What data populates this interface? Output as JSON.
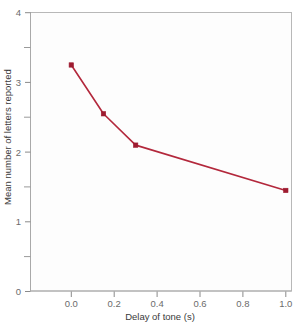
{
  "chart_data": {
    "type": "line",
    "title": "",
    "subtitle": "",
    "xlabel": "Delay of tone (s)",
    "ylabel": "Mean number of letters reported",
    "xlim": [
      -0.06,
      1.06
    ],
    "ylim": [
      0,
      4
    ],
    "grid": false,
    "legend": null,
    "series": [
      {
        "name": "Mean letters reported",
        "color": "#b3283c",
        "marker": "square",
        "x": [
          0.0,
          0.15,
          0.3,
          1.0
        ],
        "values": [
          3.25,
          2.55,
          2.1,
          1.45
        ]
      }
    ],
    "x_ticks": [
      {
        "value": 0.0,
        "label": "0.0"
      },
      {
        "value": 0.2,
        "label": "0.2"
      },
      {
        "value": 0.4,
        "label": "0.4"
      },
      {
        "value": 0.6,
        "label": "0.6"
      },
      {
        "value": 0.8,
        "label": "0.8"
      },
      {
        "value": 1.0,
        "label": "1.0"
      }
    ],
    "y_ticks": [
      {
        "value": 0,
        "label": "0"
      },
      {
        "value": 1,
        "label": "1"
      },
      {
        "value": 2,
        "label": "2"
      },
      {
        "value": 3,
        "label": "3"
      },
      {
        "value": 4,
        "label": "4"
      }
    ],
    "y_minor_ticks": [
      0.5,
      1.5,
      2.5,
      3.5
    ],
    "annotations": []
  },
  "axes": {
    "x_title": "Delay of tone (s)",
    "y_title": "Mean number of letters reported",
    "x_tick_labels": [
      "0.0",
      "0.2",
      "0.4",
      "0.6",
      "0.8",
      "1.0"
    ],
    "y_tick_labels": [
      "0",
      "1",
      "2",
      "3",
      "4"
    ]
  },
  "colors": {
    "line": "#b3283c",
    "marker": "#9e1b30",
    "frame": "#b8b8b8",
    "tick": "#8a8a8a",
    "tick_text": "#6b6b6b",
    "axis_title_text": "#3a3a3a",
    "plot_background": "#fdfdfd",
    "page_background": "#ffffff"
  }
}
